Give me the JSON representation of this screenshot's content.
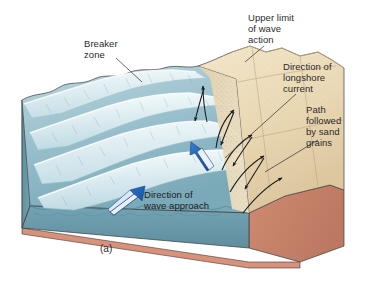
{
  "figure": {
    "caption": "(a)",
    "type": "block-diagram"
  },
  "labels": {
    "breaker_zone": "Breaker\nzone",
    "upper_limit": "Upper limit\nof wave\naction",
    "longshore_current": "Direction of\nlongshore\ncurrent",
    "sand_path": "Path\nfollowed\nby sand\ngrains",
    "wave_approach": "Direction of\nwave approach"
  },
  "colors": {
    "water_surface": "#a9ccd6",
    "water_deep": "#5f93a4",
    "water_front": "#6d9fae",
    "wave_foam": "#e3eff3",
    "wave_crest_light": "#f2f8fa",
    "sand_dry": "#ecdcbc",
    "sand_wet": "#e0cda8",
    "sand_shadow": "#d4bd94",
    "substrate": "#cc8a72",
    "substrate_edge": "#c87f66",
    "substrate_strip": "#d9917a",
    "arrow_blue": "#1f5fb4",
    "arrow_blue_light": "#7ea8dd",
    "arrow_black": "#1a1a1a",
    "leader_line": "#3a3a3a",
    "text": "#2b2b2b",
    "background": "#ffffff"
  },
  "annotations": {
    "wave_crest_count": 4,
    "sand_path_arrow_count": 9,
    "blue_arrow_count": 2
  }
}
